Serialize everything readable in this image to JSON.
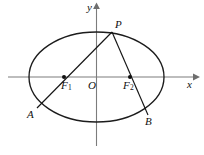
{
  "figure": {
    "background_color": "#ffffff",
    "curve_color": "#1c1c1c",
    "axis_color": "#7c7c7c",
    "label_color": "#111111"
  },
  "axes": {
    "x_label": "x",
    "y_label": "y",
    "origin_label": "O",
    "x_axis": {
      "x1": 8,
      "y1": 77,
      "x2": 196,
      "y2": 77
    },
    "y_axis": {
      "x1": 96.5,
      "y1": 5,
      "x2": 96.5,
      "y2": 146
    }
  },
  "ellipse": {
    "center_x": 96.5,
    "center_y": 77,
    "semi_major_a": 67.5,
    "semi_minor_b": 45
  },
  "points": [
    {
      "id": "P",
      "label": "P",
      "x": 112,
      "y": 32,
      "label_x": 115,
      "label_y": 20,
      "marker": false
    },
    {
      "id": "F1",
      "label": "F",
      "sub": "1",
      "x": 64,
      "y": 77,
      "label_x": 62,
      "label_y": 81,
      "marker": true
    },
    {
      "id": "F2",
      "label": "F",
      "sub": "2",
      "x": 130,
      "y": 77,
      "label_x": 124,
      "label_y": 81,
      "marker": true
    },
    {
      "id": "A",
      "label": "A",
      "x": 37,
      "y": 108,
      "label_x": 28,
      "label_y": 110,
      "marker": false
    },
    {
      "id": "B",
      "label": "B",
      "x": 148,
      "y": 115,
      "label_x": 146,
      "label_y": 117,
      "marker": false
    }
  ],
  "chords": [
    {
      "id": "PA",
      "from": "P",
      "to": "A",
      "through": "F1",
      "x1": 112,
      "y1": 32,
      "x2": 37,
      "y2": 108
    },
    {
      "id": "PB",
      "from": "P",
      "to": "B",
      "through": "F2",
      "x1": 112,
      "y1": 32,
      "x2": 148,
      "y2": 115
    }
  ]
}
